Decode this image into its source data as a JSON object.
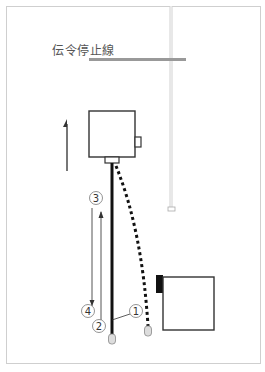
{
  "diagram": {
    "stop_line_label": "伝令停止線",
    "markers": [
      {
        "id": "1",
        "label": "1"
      },
      {
        "id": "2",
        "label": "2"
      },
      {
        "id": "3",
        "label": "3"
      },
      {
        "id": "4",
        "label": "4"
      }
    ],
    "colors": {
      "stop_line": "#999999",
      "rope": "#dddddd",
      "path_solid": "#111111",
      "path_dotted": "#111111",
      "arrow": "#555555",
      "box": "#333333",
      "frame": "#cfcfcf"
    }
  }
}
